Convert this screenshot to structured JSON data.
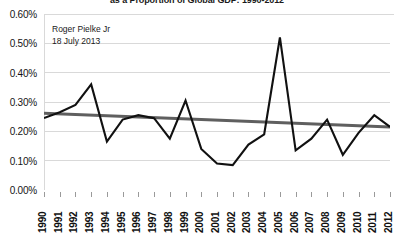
{
  "chart_data": {
    "type": "line",
    "title": "as a Proportion of Global GDP: 1990-2012",
    "xlabel": "",
    "ylabel": "",
    "ylim": [
      0.0,
      0.6
    ],
    "yticks": [
      0.0,
      0.1,
      0.2,
      0.3,
      0.4,
      0.5,
      0.6
    ],
    "ytick_labels": [
      "0.00%",
      "0.10%",
      "0.20%",
      "0.30%",
      "0.40%",
      "0.50%",
      "0.60%"
    ],
    "grid": true,
    "legend": "none",
    "categories": [
      "1990",
      "1991",
      "1992",
      "1993",
      "1994",
      "1995",
      "1996",
      "1997",
      "1998",
      "1999",
      "2000",
      "2001",
      "2002",
      "2003",
      "2004",
      "2005",
      "2006",
      "2007",
      "2008",
      "2009",
      "2010",
      "2011",
      "2012"
    ],
    "series": [
      {
        "name": "Disaster losses as proportion of global GDP",
        "type": "line",
        "color": "#111111",
        "values": [
          0.245,
          0.265,
          0.29,
          0.36,
          0.165,
          0.24,
          0.255,
          0.245,
          0.175,
          0.305,
          0.14,
          0.09,
          0.085,
          0.155,
          0.19,
          0.52,
          0.135,
          0.175,
          0.24,
          0.12,
          0.195,
          0.255,
          0.215
        ]
      },
      {
        "name": "Linear trend",
        "type": "trendline",
        "color": "#5f5f5f",
        "start_value": 0.262,
        "end_value": 0.215
      }
    ],
    "annotations": [
      {
        "name": "author",
        "text": "Roger Pielke Jr"
      },
      {
        "name": "date",
        "text": "18 July 2013"
      }
    ]
  },
  "colors": {
    "series_line": "#111111",
    "trend_line": "#5f5f5f",
    "gridline": "#d9d9d9",
    "axis": "#9a9a9a",
    "text": "#141414",
    "background": "#ffffff"
  }
}
